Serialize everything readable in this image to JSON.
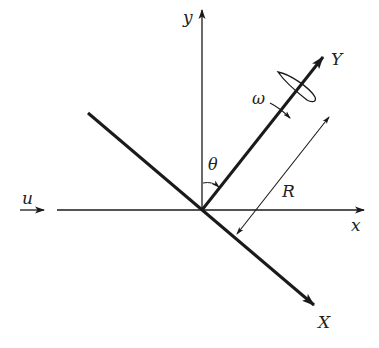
{
  "diagram": {
    "type": "coordinate-frame rotation diagram",
    "colors": {
      "stroke": "#1a1a1a",
      "background": "#ffffff"
    },
    "origin": {
      "x": 202,
      "y": 210
    },
    "labels": {
      "y_axis": "y",
      "x_axis": "x",
      "body_Y": "Y",
      "body_X": "X",
      "angle": "θ",
      "angular_velocity": "ω",
      "distance": "R",
      "freestream": "u"
    },
    "elements": [
      {
        "name": "x-axis",
        "style": "thin arrow",
        "direction": "right"
      },
      {
        "name": "y-axis",
        "style": "thin arrow",
        "direction": "up"
      },
      {
        "name": "Y-axis (rotated body frame)",
        "style": "thick arrow",
        "direction": "up-right"
      },
      {
        "name": "X-axis (rotated body frame)",
        "style": "thick arrow",
        "direction": "down-right"
      },
      {
        "name": "theta-arc",
        "between": [
          "y",
          "Y"
        ]
      },
      {
        "name": "airfoil",
        "position": "on Y-axis near tip"
      },
      {
        "name": "omega-arrow",
        "description": "rotation arrow crossing Y-axis"
      },
      {
        "name": "R-dimension",
        "style": "double-headed arrow parallel to Y-axis"
      },
      {
        "name": "u-arrow",
        "description": "freestream velocity arrow on left"
      }
    ],
    "caption_clipped": ""
  }
}
